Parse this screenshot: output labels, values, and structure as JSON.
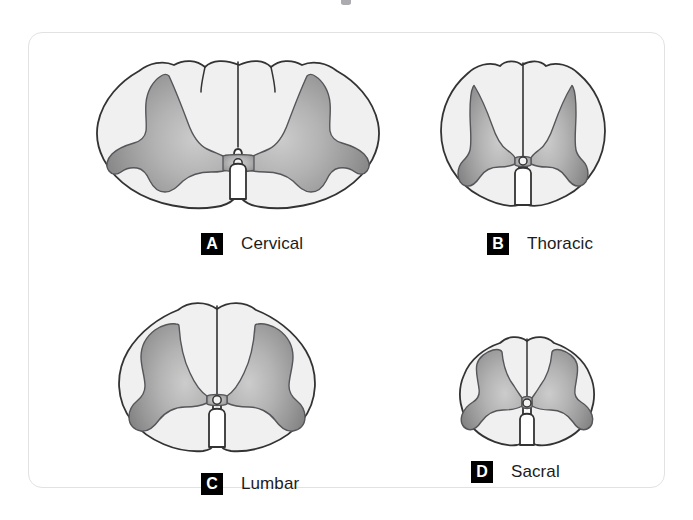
{
  "figure": {
    "kind": "anatomical-diagram",
    "frame": {
      "border_color": "#e2e2e2",
      "background": "#ffffff",
      "corner_radius_px": 14
    },
    "palette": {
      "outline": "#333333",
      "white_matter_fill": "#f0f0f0",
      "gray_matter_dark": "#8a8a8a",
      "gray_matter_mid": "#a5a5a5",
      "gray_matter_light": "#c4c4c4",
      "badge_background": "#000000",
      "badge_text": "#ffffff",
      "caption_text": "#1c1c1c"
    },
    "layout": {
      "columns": 2,
      "rows": 2,
      "order": [
        "A",
        "B",
        "C",
        "D"
      ]
    }
  },
  "panels": [
    {
      "id": "cervical",
      "badge": "A",
      "label": "Cervical",
      "relative_size": "largest",
      "outline_shape": "wide oval, scalloped dorsal margin",
      "gray_matter": "large butterfly, broad blunt anterior horns",
      "central_canal": "small circle at center"
    },
    {
      "id": "thoracic",
      "badge": "B",
      "label": "Thoracic",
      "relative_size": "medium-small",
      "outline_shape": "nearly round",
      "gray_matter": "slender H, thin elongated horns",
      "central_canal": "small circle at center"
    },
    {
      "id": "lumbar",
      "badge": "C",
      "label": "Lumbar",
      "relative_size": "large, round",
      "outline_shape": "round with deep ventral fissure",
      "gray_matter": "bulky, very broad anterior horns",
      "central_canal": "small circle at center"
    },
    {
      "id": "sacral",
      "badge": "D",
      "label": "Sacral",
      "relative_size": "smallest",
      "outline_shape": "small and round",
      "gray_matter": "proportionally largest, fills most of section",
      "central_canal": "small circle at center"
    }
  ]
}
